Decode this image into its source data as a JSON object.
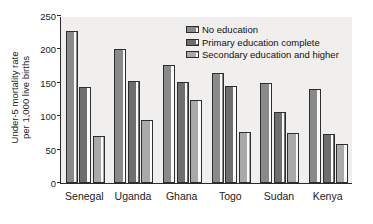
{
  "chart_data": {
    "type": "bar",
    "title": "",
    "subtitle": "",
    "xlabel": "",
    "ylabel": "Under-5 mortality rate per 1,000 live births",
    "ylabel_lines": [
      "Under-5 mortality rate",
      "per 1,000 live births"
    ],
    "categories": [
      "Senegal",
      "Uganda",
      "Ghana",
      "Togo",
      "Sudan",
      "Kenya"
    ],
    "series": [
      {
        "name": "No education",
        "color": "#8a8a8a",
        "values": [
          228,
          201,
          177,
          165,
          149,
          140
        ]
      },
      {
        "name": "Primary education complete",
        "color": "#6e6e6e",
        "values": [
          144,
          152,
          151,
          145,
          107,
          73
        ]
      },
      {
        "name": "Secondary education and higher",
        "color": "#a9a9a9",
        "values": [
          71,
          95,
          125,
          76,
          75,
          59
        ]
      }
    ],
    "ylim": [
      0,
      250
    ],
    "yticks": [
      0,
      50,
      100,
      150,
      200,
      250
    ],
    "ytick_labels": [
      "0",
      "50",
      "100",
      "150",
      "200",
      "250"
    ],
    "grid": false,
    "legend_position": "top-right",
    "plot_background": "#f0efee",
    "axis_color": "#2b2b2b"
  }
}
